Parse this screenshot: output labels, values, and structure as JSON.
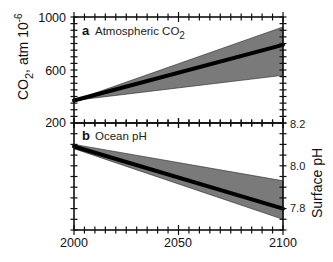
{
  "chart_data": [
    {
      "type": "area",
      "panel": "a",
      "title": "Atmospheric CO",
      "title_subscript": "2",
      "xlabel": "",
      "ylabel": "CO",
      "ylabel_subscript": "2",
      "ylabel_suffix": ", atm 10",
      "ylabel_superscript": "-6",
      "xlim": [
        2000,
        2100
      ],
      "ylim": [
        200,
        1000
      ],
      "yticks": [
        200,
        600,
        1000
      ],
      "ytick_labels": [
        "200",
        "600",
        "1000"
      ],
      "x": [
        2000,
        2100
      ],
      "series": [
        {
          "name": "upper",
          "values": [
            370,
            925
          ]
        },
        {
          "name": "central",
          "values": [
            370,
            790
          ]
        },
        {
          "name": "lower",
          "values": [
            370,
            560
          ]
        }
      ],
      "grid": false
    },
    {
      "type": "area",
      "panel": "b",
      "title": "Ocean pH",
      "xlabel": "",
      "ylabel": "Surface pH",
      "xlim": [
        2000,
        2100
      ],
      "ylim": [
        7.7,
        8.2
      ],
      "yticks": [
        7.8,
        8.0,
        8.2
      ],
      "ytick_labels": [
        "7.8",
        "8.0",
        "8.2"
      ],
      "xticks": [
        2000,
        2050,
        2100
      ],
      "xtick_labels": [
        "2000",
        "2050",
        "2100"
      ],
      "x": [
        2000,
        2100
      ],
      "series": [
        {
          "name": "upper",
          "values": [
            8.1,
            7.93
          ]
        },
        {
          "name": "central",
          "values": [
            8.09,
            7.8
          ]
        },
        {
          "name": "lower",
          "values": [
            8.08,
            7.75
          ]
        }
      ],
      "grid": false
    }
  ],
  "colors": {
    "band": "#7a7a7a",
    "line": "#000000",
    "axis": "#111111"
  }
}
